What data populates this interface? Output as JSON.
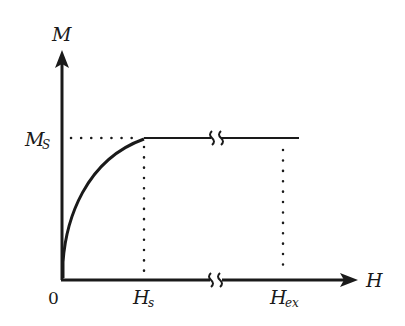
{
  "diagram": {
    "type": "magnetization-curve",
    "axes": {
      "y_label": "M",
      "x_label": "H",
      "origin_label": "0"
    },
    "y_ticks": [
      {
        "main": "M",
        "sub": "S"
      }
    ],
    "x_ticks": [
      {
        "main": "H",
        "sub": "s"
      },
      {
        "main": "H",
        "sub": "ex"
      }
    ],
    "breaks": [
      "axis-break",
      "curve-break"
    ],
    "colors": {
      "line": "#1a1a1a",
      "background": "#ffffff"
    }
  }
}
